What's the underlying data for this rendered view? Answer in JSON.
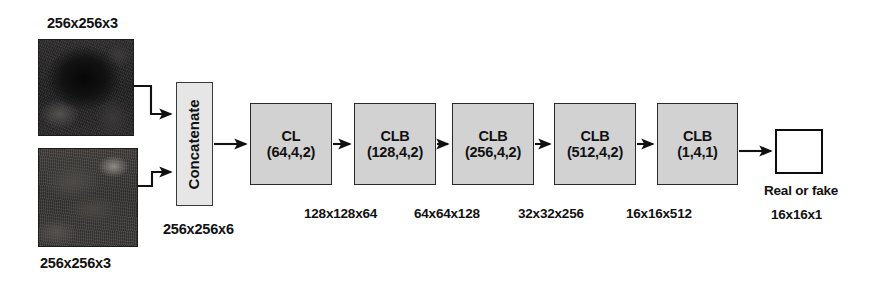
{
  "figure": {
    "colors": {
      "block_fill": "#d2d2d2",
      "concat_fill": "#e6e6e6",
      "output_fill": "#ffffff",
      "stroke": "#1c1c1c",
      "background": "#ffffff"
    }
  },
  "inputs": [
    {
      "name": "input-image-top",
      "caption": "256x256x3",
      "caption_position": "above"
    },
    {
      "name": "input-image-bottom",
      "caption": "256x256x3",
      "caption_position": "below"
    }
  ],
  "concatenate": {
    "label": "Concatenate",
    "output_shape": "256x256x6"
  },
  "blocks": [
    {
      "type": "CL",
      "params": "(64,4,2)",
      "output_shape": "128x128x64"
    },
    {
      "type": "CLB",
      "params": "(128,4,2)",
      "output_shape": "64x64x128"
    },
    {
      "type": "CLB",
      "params": "(256,4,2)",
      "output_shape": "32x32x256"
    },
    {
      "type": "CLB",
      "params": "(512,4,2)",
      "output_shape": "16x16x512"
    },
    {
      "type": "CLB",
      "params": "(1,4,1)",
      "output_shape": "16x16x1"
    }
  ],
  "output": {
    "label": "Real or fake",
    "shape": "16x16x1"
  }
}
